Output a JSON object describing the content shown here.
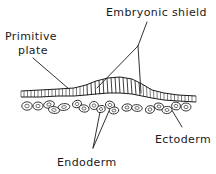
{
  "figure": {
    "type": "biological-line-drawing",
    "background_color": "#ffffff",
    "ink_color": "#1a1a1a",
    "width": 216,
    "height": 174
  },
  "labels": {
    "embryonic_shield": "Embryonic shield",
    "primitive_plate_line1": "Primitive",
    "primitive_plate_line2": "plate",
    "endoderm": "Endoderm",
    "ectoderm": "Ectoderm"
  },
  "structures": {
    "epithelial_band": {
      "name": "ectoderm-epithelial-band",
      "description": "Continuous row of columnar cells, thickened at center"
    },
    "shield_thickening": {
      "name": "embryonic-shield-thickening",
      "description": "Tall columnar cells forming a raised mound at center"
    },
    "loose_cells": {
      "name": "endoderm-loose-cells",
      "description": "Scattered oval nucleated cells beneath the band"
    }
  },
  "leaders": {
    "embryonic_shield_vertex": "138,46",
    "embryonic_shield_left_end": "97,88",
    "embryonic_shield_right_end": "141,93",
    "primitive_plate_end": "69,89",
    "endoderm_vertex": "93,148",
    "endoderm_left_end": "100,112",
    "endoderm_right_end": "109,111",
    "ectoderm_start": "170,107",
    "ectoderm_end": "182,127"
  }
}
